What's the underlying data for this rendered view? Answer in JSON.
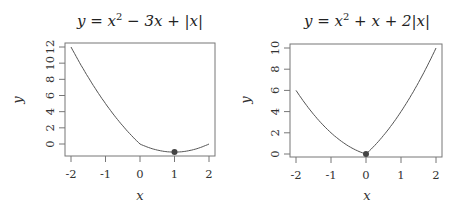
{
  "chart_data": [
    {
      "type": "line",
      "title": "y = x^2 - 3x + |x|",
      "title_parts": {
        "pre": "y = x",
        "sup": "2",
        "post": " − 3x + |x|"
      },
      "xlabel": "x",
      "ylabel": "y",
      "xlim": [
        -2,
        2
      ],
      "ylim": [
        -1,
        12
      ],
      "x_ticks": [
        "-2",
        "-1",
        "0",
        "1",
        "2"
      ],
      "y_ticks": [
        "0",
        "2",
        "4",
        "6",
        "8",
        "10",
        "12"
      ],
      "x": [
        -2,
        -1.5,
        -1,
        -0.5,
        0,
        0.5,
        1,
        1.5,
        2
      ],
      "values": [
        12,
        8.25,
        5,
        2.25,
        0,
        -0.75,
        -1,
        -0.75,
        0
      ],
      "highlight_point": {
        "x": 1,
        "y": -1
      },
      "grid": false,
      "line_color": "#555555"
    },
    {
      "type": "line",
      "title": "y = x^2 + x + 2|x|",
      "title_parts": {
        "pre": "y = x",
        "sup": "2",
        "post": " + x + 2|x|"
      },
      "xlabel": "x",
      "ylabel": "y",
      "xlim": [
        -2,
        2
      ],
      "ylim": [
        0,
        10
      ],
      "x_ticks": [
        "-2",
        "-1",
        "0",
        "1",
        "2"
      ],
      "y_ticks": [
        "0",
        "2",
        "4",
        "6",
        "8",
        "10"
      ],
      "x": [
        -2,
        -1.5,
        -1,
        -0.5,
        0,
        0.5,
        1,
        1.5,
        2
      ],
      "values": [
        6,
        3.75,
        2,
        0.75,
        0,
        1.75,
        4,
        6.75,
        10
      ],
      "highlight_point": {
        "x": 0,
        "y": 0
      },
      "grid": false,
      "line_color": "#555555"
    }
  ]
}
